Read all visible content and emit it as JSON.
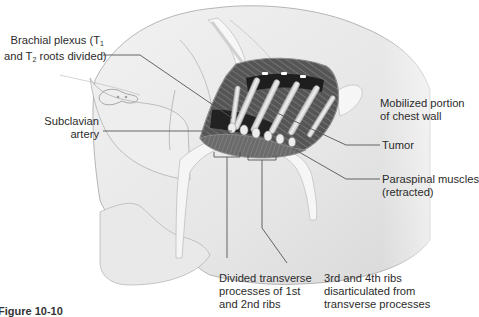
{
  "figure": {
    "caption": "Figure 10-10",
    "colors": {
      "skin": "#ececec",
      "outline": "#9a9a9a",
      "cavity": "#4a4a4a",
      "cavity_dark": "#1e1e1e",
      "rib": "#e4e4e4",
      "retractor": "#f4f4f4",
      "leader_line": "#555555"
    }
  },
  "labels": {
    "brachial_plexus": {
      "line1": "Brachial plexus (T",
      "sub1": "1",
      "line2a": "and T",
      "sub2": "2",
      "line2b": " roots divided)"
    },
    "subclavian_artery": {
      "line1": "Subclavian",
      "line2": "artery"
    },
    "mobilized_chest_wall": {
      "line1": "Mobilized portion",
      "line2": "of chest wall"
    },
    "tumor": {
      "text": "Tumor"
    },
    "paraspinal_muscles": {
      "line1": "Paraspinal muscles",
      "line2": "(retracted)"
    },
    "divided_transverse": {
      "line1": "Divided transverse",
      "line2": "processes of 1st",
      "line3": "and 2nd ribs"
    },
    "ribs_disarticulated": {
      "line1": "3rd and 4th ribs",
      "line2": "disarticulated from",
      "line3": "transverse processes"
    }
  }
}
